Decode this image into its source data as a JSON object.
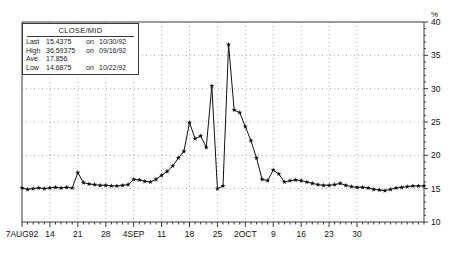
{
  "legend": {
    "title": "CLOSE/MID",
    "rows": [
      {
        "key": "Last",
        "value": "15.4375",
        "on": "on",
        "date": "10/30/92"
      },
      {
        "key": "High",
        "value": "36.59375",
        "on": "on",
        "date": "09/16/92"
      },
      {
        "key": "Ave",
        "value": "17.856",
        "on": "",
        "date": ""
      },
      {
        "key": "Low",
        "value": "14.6875",
        "on": "on",
        "date": "10/22/92"
      }
    ]
  },
  "axes": {
    "y_unit": "%",
    "y_ticks": [
      "40",
      "35",
      "30",
      "25",
      "20",
      "15",
      "10"
    ],
    "x_ticks": [
      "7AUG92",
      "14",
      "21",
      "28",
      "4SEP",
      "11",
      "18",
      "25",
      "2OCT",
      "9",
      "16",
      "23",
      "30"
    ]
  },
  "chart_data": {
    "type": "line",
    "title": "CLOSE/MID",
    "xlabel": "",
    "ylabel": "%",
    "ylim": [
      10,
      40
    ],
    "grid": true,
    "legend_position": "top-left",
    "marker": "star",
    "x_tick_labels": [
      "7AUG92",
      "14",
      "21",
      "28",
      "4SEP",
      "11",
      "18",
      "25",
      "2OCT",
      "9",
      "16",
      "23",
      "30"
    ],
    "x_tick_indices": [
      0,
      5,
      10,
      15,
      20,
      25,
      30,
      35,
      40,
      45,
      50,
      55,
      60
    ],
    "annotations": {
      "last": 15.4375,
      "last_date": "10/30/92",
      "high": 36.59375,
      "high_date": "09/16/92",
      "average": 17.856,
      "low": 14.6875,
      "low_date": "10/22/92"
    },
    "series": [
      {
        "name": "CLOSE/MID",
        "values": [
          15.1,
          14.9,
          15.0,
          15.1,
          15.0,
          15.1,
          15.2,
          15.1,
          15.2,
          15.1,
          17.4,
          15.9,
          15.7,
          15.6,
          15.5,
          15.5,
          15.4,
          15.4,
          15.5,
          15.6,
          16.4,
          16.3,
          16.1,
          16.0,
          16.4,
          17.0,
          17.6,
          18.4,
          19.6,
          20.6,
          24.9,
          22.5,
          22.9,
          21.2,
          30.4,
          15.0,
          15.4,
          36.6,
          26.8,
          26.4,
          24.3,
          22.2,
          19.6,
          16.4,
          16.2,
          17.8,
          17.2,
          16.0,
          16.2,
          16.3,
          16.2,
          16.0,
          15.8,
          15.6,
          15.5,
          15.5,
          15.6,
          15.8,
          15.5,
          15.3,
          15.2,
          15.2,
          15.1,
          14.9,
          14.8,
          14.7,
          14.9,
          15.1,
          15.2,
          15.3,
          15.4,
          15.4,
          15.4
        ]
      }
    ]
  }
}
